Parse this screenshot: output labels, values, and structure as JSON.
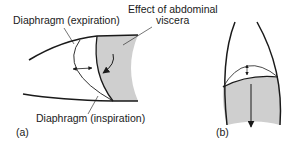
{
  "figure": {
    "panel_a": {
      "tag": "(a)",
      "labels": {
        "expiration": "Diaphragm (expiration)",
        "effect_line1": "Effect of abdominal",
        "effect_line2": "viscera",
        "inspiration": "Diaphragm (inspiration)"
      }
    },
    "panel_b": {
      "tag": "(b)"
    },
    "colors": {
      "stroke": "#1a1a1a",
      "shade": "#cfcfcf",
      "background": "#ffffff"
    }
  }
}
